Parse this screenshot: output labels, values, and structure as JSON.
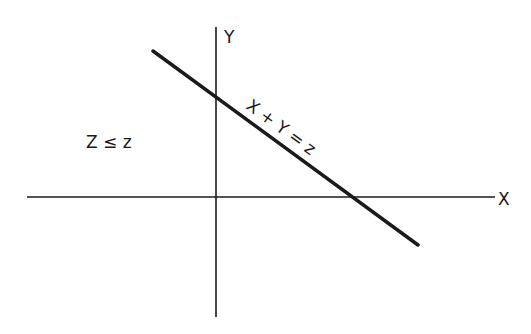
{
  "diagram": {
    "type": "coordinate-plane",
    "axes": {
      "x_label": "X",
      "y_label": "Y"
    },
    "line": {
      "equation_label": "X + Y = z"
    },
    "region_label": "Z ≤ z",
    "colors": {
      "background": "#ffffff",
      "ink": "#1a1a1a"
    }
  }
}
